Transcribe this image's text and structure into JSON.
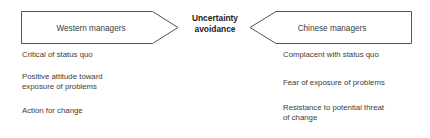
{
  "diagram": {
    "center": {
      "title_lines": [
        "Uncertainty",
        "avoidance"
      ],
      "title_full": "Uncertainty avoidance",
      "color": "#1d1d1d"
    },
    "left_arrow": {
      "label": "Western managers",
      "direction": "right",
      "fill": "#ffffff",
      "stroke": "#555555"
    },
    "right_arrow": {
      "label": "Chinese managers",
      "direction": "left",
      "fill": "#ffffff",
      "stroke": "#555555"
    },
    "left_column": {
      "items": [
        {
          "lines": [
            "Critical of status quo"
          ]
        },
        {
          "lines": [
            "Positive attitude toward",
            "exposure of problems"
          ]
        },
        {
          "lines": [
            "Action for change"
          ]
        }
      ]
    },
    "right_column": {
      "items": [
        {
          "lines": [
            "Complacent with status quo"
          ]
        },
        {
          "lines": [
            "Fear of exposure of problems"
          ]
        },
        {
          "lines": [
            "Resistance to potential threat",
            "of change"
          ]
        }
      ]
    },
    "text_color": "#3c3c3c",
    "background": "#ffffff"
  }
}
